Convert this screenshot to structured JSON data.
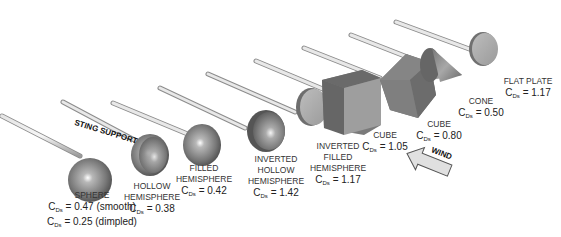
{
  "sting_label": "STING SUPPORT",
  "wind_label": "WIND",
  "cd_symbol": "C",
  "cd_subscript": "Ds",
  "objects": [
    {
      "name": "SPHERE",
      "name2": "",
      "name3": "",
      "cd1": "= 0.47 (smooth)",
      "cd2": "= 0.25 (dimpled)"
    },
    {
      "name": "HOLLOW",
      "name2": "HEMISPHERE",
      "name3": "",
      "cd1": "= 0.38"
    },
    {
      "name": "FILLED",
      "name2": "HEMISPHERE",
      "name3": "",
      "cd1": "= 0.42"
    },
    {
      "name": "INVERTED",
      "name2": "HOLLOW",
      "name3": "HEMISPHERE",
      "cd1": "= 1.42"
    },
    {
      "name": "INVERTED",
      "name2": "FILLED",
      "name3": "HEMISPHERE",
      "cd1": "= 1.17"
    },
    {
      "name": "CUBE",
      "name2": "",
      "name3": "",
      "cd1": "= 1.05"
    },
    {
      "name": "CUBE",
      "name2": "",
      "name3": "",
      "cd1": "= 0.80"
    },
    {
      "name": "CONE",
      "name2": "",
      "name3": "",
      "cd1": "= 0.50"
    },
    {
      "name": "FLAT PLATE",
      "name2": "",
      "name3": "",
      "cd1": "= 1.17"
    }
  ]
}
